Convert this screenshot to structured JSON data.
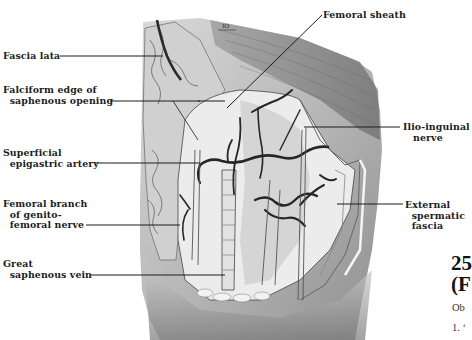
{
  "figure": {
    "labels_left": [
      {
        "id": "fascia-lata",
        "text": "Fascia lata"
      },
      {
        "id": "falciform-edge",
        "text": "Falciform edge of\n  saphenous opening"
      },
      {
        "id": "superficial-epigastric-artery",
        "text": "Superficial\n  epigastric artery"
      },
      {
        "id": "femoral-branch-genitofemoral",
        "text": "Femoral branch\n  of genito-\n  femoral nerve"
      },
      {
        "id": "great-saphenous-vein",
        "text": "Great\n  saphenous vein"
      }
    ],
    "labels_right": [
      {
        "id": "femoral-sheath",
        "text": "Femoral sheath"
      },
      {
        "id": "ilio-inguinal-nerve",
        "text": "Ilio-inguinal\n   nerve"
      },
      {
        "id": "external-spermatic-fascia",
        "text": "External\n  spermatic\n  fascia"
      }
    ],
    "scale_mark": "IO"
  },
  "page_text": {
    "heading_line1": "25",
    "heading_line2": "(F",
    "body_line1": "Ob",
    "body_line2": "1. ‘"
  }
}
